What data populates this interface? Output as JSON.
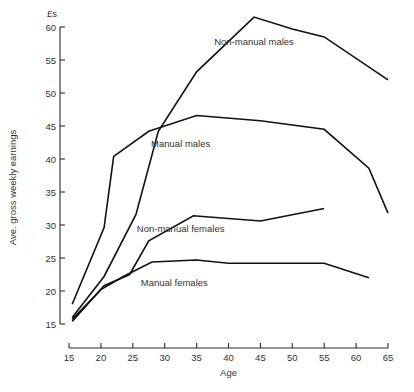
{
  "chart_data": {
    "type": "line",
    "title": "",
    "xlabel": "Age",
    "ylabel": "Ave. gross weekly earnings",
    "yunit": "£s",
    "xlim": [
      15,
      65
    ],
    "ylim": [
      15,
      60
    ],
    "xticks": [
      15,
      20,
      25,
      30,
      35,
      40,
      45,
      50,
      55,
      60,
      65
    ],
    "xtick_labels": [
      "15",
      "20",
      "25",
      "30",
      "35",
      "40",
      "45",
      "50",
      "55",
      "60",
      "65"
    ],
    "yticks": [
      15,
      20,
      25,
      30,
      35,
      40,
      45,
      50,
      55,
      60
    ],
    "ytick_labels": [
      "15",
      "20",
      "25",
      "30",
      "35",
      "40",
      "45",
      "50",
      "55",
      "60"
    ],
    "grid": false,
    "legend_position": "inline-annotations",
    "series": [
      {
        "name": "Non-manual males",
        "label_x": 44,
        "label_y": 57.2,
        "x": [
          15.5,
          20.5,
          25.5,
          29,
          35,
          44,
          50,
          55,
          65
        ],
        "y": [
          16.0,
          22.2,
          31.6,
          44.2,
          53.2,
          61.5,
          59.7,
          58.5,
          52.0
        ]
      },
      {
        "name": "Manual males",
        "label_x": 32.5,
        "label_y": 41.8,
        "x": [
          15.5,
          20.5,
          22,
          27.5,
          35,
          45,
          55,
          62,
          65
        ],
        "y": [
          18.0,
          29.6,
          40.4,
          44.2,
          46.6,
          45.8,
          44.5,
          38.6,
          31.8
        ]
      },
      {
        "name": "Non-manual females",
        "label_x": 32.5,
        "label_y": 28.9,
        "x": [
          15.5,
          20.5,
          24.5,
          27.5,
          34.5,
          45,
          55
        ],
        "y": [
          15.4,
          20.8,
          22.5,
          27.6,
          31.4,
          30.6,
          32.5
        ]
      },
      {
        "name": "Manual females",
        "label_x": 31.5,
        "label_y": 20.8,
        "x": [
          15.5,
          20.0,
          23.5,
          28,
          35,
          40,
          55,
          62
        ],
        "y": [
          15.7,
          20.2,
          22.2,
          24.4,
          24.7,
          24.2,
          24.2,
          22.0
        ]
      }
    ]
  }
}
